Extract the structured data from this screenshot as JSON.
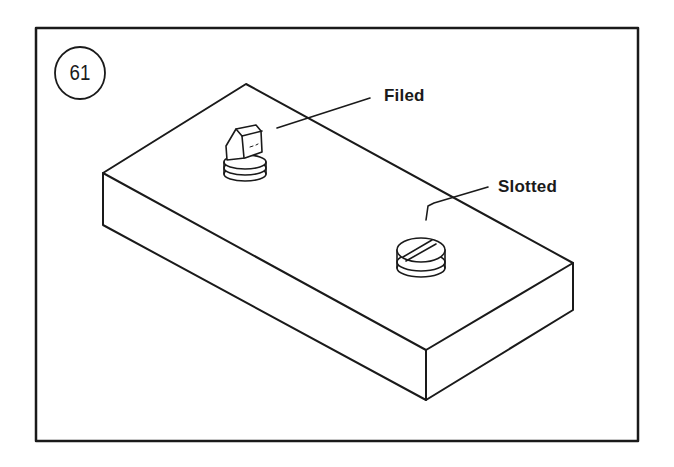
{
  "figure": {
    "number": "61",
    "labels": {
      "filed": "Filed",
      "slotted": "Slotted"
    },
    "colors": {
      "ink": "#1a1a1a",
      "background": "#ffffff"
    },
    "parts": [
      {
        "name": "block",
        "description": "rectangular block, isometric view"
      },
      {
        "name": "filed-plug",
        "label": "Filed"
      },
      {
        "name": "slotted-screw",
        "label": "Slotted"
      }
    ]
  }
}
